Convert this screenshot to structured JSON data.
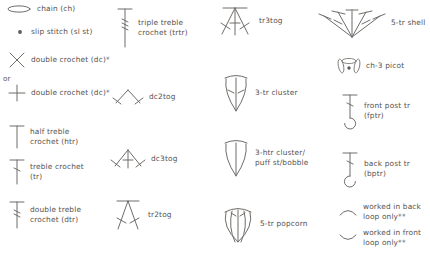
{
  "legend": {
    "note_or": "or",
    "columns": [
      {
        "name": "column-1",
        "entries": [
          {
            "symbol": "chain-symbol",
            "label": "chain (ch)"
          },
          {
            "symbol": "slip-stitch-symbol",
            "label": "slip stitch (sl st)"
          },
          {
            "symbol": "double-crochet-x-symbol",
            "label": "double crochet (dc)*"
          },
          {
            "symbol": "double-crochet-plus-symbol",
            "label": "double crochet (dc)*"
          },
          {
            "symbol": "half-treble-symbol",
            "label": "half treble\ncrochet (htr)"
          },
          {
            "symbol": "treble-symbol",
            "label": "treble crochet\n(tr)"
          },
          {
            "symbol": "double-treble-symbol",
            "label": "double treble\ncrochet (dtr)"
          }
        ]
      },
      {
        "name": "column-2",
        "entries": [
          {
            "symbol": "triple-treble-symbol",
            "label": "triple treble\ncrochet (trtr)"
          },
          {
            "symbol": "dc2tog-symbol",
            "label": "dc2tog"
          },
          {
            "symbol": "dc3tog-symbol",
            "label": "dc3tog"
          },
          {
            "symbol": "tr2tog-symbol",
            "label": "tr2tog"
          }
        ]
      },
      {
        "name": "column-3",
        "entries": [
          {
            "symbol": "tr3tog-symbol",
            "label": "tr3tog"
          },
          {
            "symbol": "three-tr-cluster-symbol",
            "label": "3-tr cluster"
          },
          {
            "symbol": "three-htr-cluster-symbol",
            "label": "3-htr cluster/\npuff st/bobble"
          },
          {
            "symbol": "five-tr-popcorn-symbol",
            "label": "5-tr popcorn"
          }
        ]
      },
      {
        "name": "column-4",
        "entries": [
          {
            "symbol": "five-tr-shell-symbol",
            "label": "5-tr shell"
          },
          {
            "symbol": "ch3-picot-symbol",
            "label": "ch-3 picot"
          },
          {
            "symbol": "front-post-tr-symbol",
            "label": "front post tr\n(fptr)"
          },
          {
            "symbol": "back-post-tr-symbol",
            "label": "back post tr\n(bptr)"
          },
          {
            "symbol": "back-loop-only-symbol",
            "label": "worked in back\nloop only**"
          },
          {
            "symbol": "front-loop-only-symbol",
            "label": "worked in front\nloop only**"
          }
        ]
      }
    ]
  },
  "colors": {
    "stroke": "#6f6c69",
    "text": "#55524f",
    "background": "#ffffff"
  }
}
